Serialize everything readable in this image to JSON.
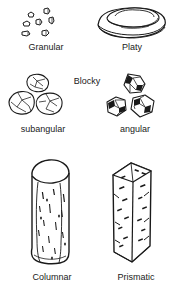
{
  "diagram": {
    "background_color": "#ffffff",
    "line_color": "#1a1a1a",
    "text_color": "#1a1a1a",
    "fill_color": "#ffffff"
  },
  "rows": [
    {
      "row_name": "row-granular-platy",
      "items": [
        {
          "name": "granular",
          "label": "Granular",
          "shape": "scattered-small-granules"
        },
        {
          "name": "platy",
          "label": "Platy",
          "shape": "flat-stacked-plates"
        }
      ]
    },
    {
      "row_name": "row-blocky",
      "group_label": "Blocky",
      "items": [
        {
          "name": "subangular-blocky",
          "label": "subangular",
          "shape": "rounded-blocky-peds"
        },
        {
          "name": "angular-blocky",
          "label": "angular",
          "shape": "sharp-blocky-peds"
        }
      ]
    },
    {
      "row_name": "row-columnar-prismatic",
      "items": [
        {
          "name": "columnar",
          "label": "Columnar",
          "shape": "column-rounded-top"
        },
        {
          "name": "prismatic",
          "label": "Prismatic",
          "shape": "column-flat-top"
        }
      ]
    }
  ]
}
